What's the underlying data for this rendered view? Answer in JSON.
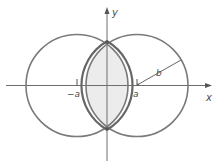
{
  "diagram": {
    "type": "two-overlapping-circles",
    "colors": {
      "circle_stroke": "#7a7a7a",
      "lens_stroke": "#666666",
      "lens_fill": "#ececec",
      "axis": "#6e6e6e",
      "label": "#4a4a4a"
    },
    "axes": {
      "x_label": "x",
      "y_label": "y"
    },
    "labels": {
      "neg_a": "−a",
      "pos_a": "a",
      "radius": "b"
    },
    "circles": [
      {
        "name": "left-circle",
        "center": "(-a, 0)",
        "radius": "b"
      },
      {
        "name": "right-circle",
        "center": "(a, 0)",
        "radius": "b"
      }
    ],
    "shaded_region": "intersection (lens) of the two circles"
  }
}
